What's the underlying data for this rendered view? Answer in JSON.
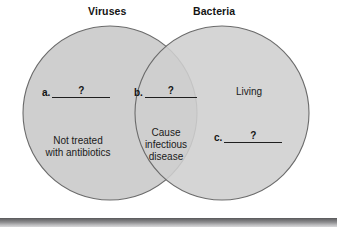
{
  "figure": {
    "type": "venn-diagram",
    "sets": 2,
    "background_color": "#ffffff",
    "circle_fill": "#cfcfcf",
    "circle_stroke": "#6b6b6b"
  },
  "titles": {
    "left": "Viruses",
    "right": "Bacteria"
  },
  "regions": {
    "left_only": {
      "label": "Not treated\nwith antibiotics"
    },
    "intersection": {
      "label": "Cause\ninfectious\ndisease"
    },
    "right_only": {
      "label": "Living"
    }
  },
  "blanks": [
    {
      "id": "a",
      "label": "a.",
      "value": "?"
    },
    {
      "id": "b",
      "label": "b.",
      "value": "?"
    },
    {
      "id": "c",
      "label": "c.",
      "value": "?"
    }
  ],
  "strip": {
    "name": "bottom-gradient-bar",
    "top_color": "#58585a",
    "bottom_color": "#d8d8da"
  }
}
